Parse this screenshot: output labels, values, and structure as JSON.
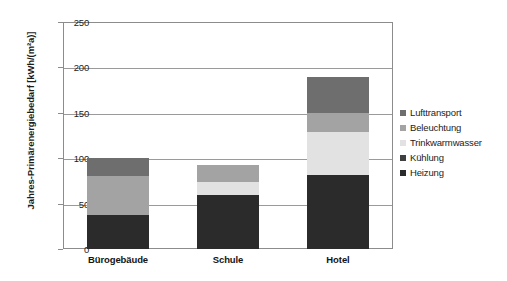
{
  "chart_data": {
    "type": "bar",
    "subtype": "stacked-vertical",
    "title": "",
    "xlabel": "",
    "ylabel": "Jahres-Primärenergiebedarf [kWh/(m²a)]",
    "categories": [
      "Bürogebäude",
      "Schule",
      "Hotel"
    ],
    "ylim": [
      0,
      250
    ],
    "yticks": [
      0,
      50,
      100,
      150,
      200,
      250
    ],
    "ytick_labels": [
      "0",
      "50",
      "100",
      "150",
      "200",
      "250"
    ],
    "grid": true,
    "grid_axis": "y",
    "legend_position": "right",
    "series": [
      {
        "name": "Heizung",
        "color": "#2b2b2b",
        "values": [
          38,
          60,
          81
        ]
      },
      {
        "name": "Kühlung",
        "color": "#3f3f3f",
        "values": [
          0,
          0,
          0
        ]
      },
      {
        "name": "Trinkwarmwasser",
        "color": "#e2e2e2",
        "values": [
          0,
          14,
          48
        ]
      },
      {
        "name": "Beleuchtung",
        "color": "#a3a3a3",
        "values": [
          42,
          18,
          21
        ]
      },
      {
        "name": "Lufttransport",
        "color": "#6e6e6e",
        "values": [
          20,
          0,
          40
        ]
      }
    ],
    "totals": [
      100,
      92,
      190
    ],
    "legend_order": [
      "Lufttransport",
      "Beleuchtung",
      "Trinkwarmwasser",
      "Kühlung",
      "Heizung"
    ]
  },
  "colors": {
    "axis": "#8c8c8c",
    "grid": "#9a9a9a",
    "text": "#1c1c1c",
    "background": "#ffffff"
  }
}
